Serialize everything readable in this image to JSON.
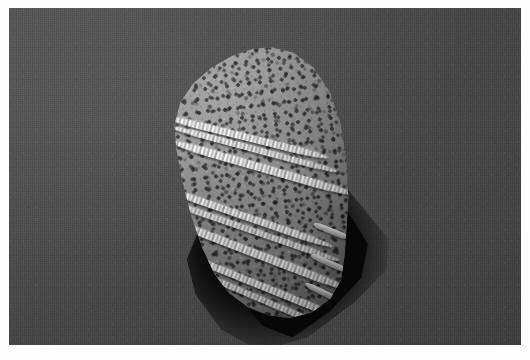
{
  "figure": {
    "kind": "scanning-electron-micrograph",
    "modality": "grayscale",
    "caption": "",
    "border": {
      "style": "white photographic margin",
      "color": "#fdfdfd",
      "left_px": 9,
      "top_px": 8,
      "right_px": 9,
      "bottom_px": 15
    },
    "plate": {
      "width_px": 512,
      "height_px": 337,
      "background_color": "#4c4c4c",
      "background_description": "uniform dark grey SEM stub surface with fine horizontal scan-line grain",
      "grain": "fine vertical scan lines and film speckle"
    },
    "subject": {
      "name": "porous specimen",
      "description": "ovate, dome-apexed specimen with densely perforated surface crossed by several raised transverse ridge bands",
      "surface_texture": "densely pitted / perforated (foveolate)",
      "body_color": "#8a8a8a",
      "highlight_color": "#e8e8e8",
      "pore_color": "#1b1b1b",
      "orientation": "apex up, slightly tilted; long axis near-vertical",
      "bounds_px": {
        "x": 160,
        "y": 38,
        "width": 183,
        "height": 272
      }
    },
    "ridges": {
      "label": "raised transverse ridge bands",
      "count": 9,
      "color": "#ededed",
      "description": "bright, knobbly rope-like bands running obliquely down-right across the specimen",
      "bands": [
        {
          "id": "ridge-1",
          "angle_deg": 14,
          "position": "upper"
        },
        {
          "id": "ridge-1b",
          "angle_deg": 15,
          "position": "upper"
        },
        {
          "id": "ridge-2",
          "angle_deg": 16,
          "position": "upper-mid"
        },
        {
          "id": "ridge-3",
          "angle_deg": 19,
          "position": "mid"
        },
        {
          "id": "ridge-3b",
          "angle_deg": 19,
          "position": "mid"
        },
        {
          "id": "ridge-4",
          "angle_deg": 21,
          "position": "lower-mid"
        },
        {
          "id": "ridge-5",
          "angle_deg": 22,
          "position": "lower"
        },
        {
          "id": "ridge-5b",
          "angle_deg": 23,
          "position": "lower"
        }
      ],
      "stubs": [
        {
          "id": "stub-1",
          "angle_deg": 22
        },
        {
          "id": "stub-2",
          "angle_deg": 24
        },
        {
          "id": "stub-3",
          "angle_deg": 26
        }
      ]
    },
    "shadow": {
      "label": "cast shadow",
      "color": "#080808",
      "description": "hard near-black cast shadow falling to the lower-right and below the specimen",
      "bounds_px": {
        "x": 165,
        "y": 150,
        "width": 215,
        "height": 195
      }
    }
  }
}
